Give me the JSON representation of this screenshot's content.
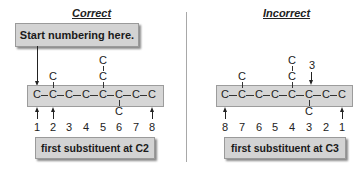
{
  "left_panel": {
    "heading": "Correct",
    "callout_top": "Start numbering here.",
    "chain_atoms": [
      "C",
      "C",
      "C",
      "C",
      "C",
      "C",
      "C",
      "C"
    ],
    "bond": "–",
    "substituents_above": [
      {
        "position_index": 1,
        "atoms": [
          "C"
        ]
      },
      {
        "position_index": 4,
        "atoms": [
          "C",
          "C"
        ]
      }
    ],
    "substituents_below": [
      {
        "position_index": 5,
        "atoms": [
          "C"
        ]
      }
    ],
    "numbers": [
      "1",
      "2",
      "3",
      "4",
      "5",
      "6",
      "7",
      "8"
    ],
    "callout_bottom": "first substituent at C2"
  },
  "right_panel": {
    "heading": "Incorrect",
    "chain_atoms": [
      "C",
      "C",
      "C",
      "C",
      "C",
      "C",
      "C",
      "C"
    ],
    "bond": "–",
    "substituents_above": [
      {
        "position_index": 1,
        "atoms": [
          "C"
        ]
      },
      {
        "position_index": 4,
        "atoms": [
          "C",
          "C"
        ]
      }
    ],
    "substituents_below": [
      {
        "position_index": 5,
        "atoms": [
          "C"
        ]
      }
    ],
    "pointer_label": "3",
    "numbers": [
      "8",
      "7",
      "6",
      "5",
      "4",
      "3",
      "2",
      "1"
    ],
    "callout_bottom": "first substituent at C3"
  },
  "colors": {
    "box_fill": "#d6d6d6",
    "box_border": "#9c9c9c",
    "text": "#222222",
    "divider": "#a8a8a8"
  }
}
